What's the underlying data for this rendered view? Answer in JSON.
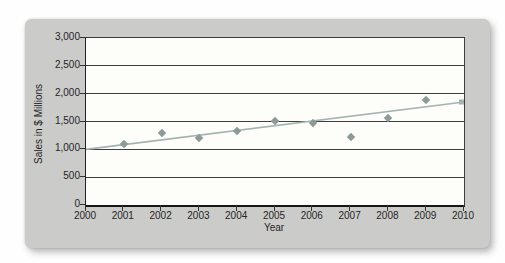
{
  "figure": {
    "page_background": "#fefefe",
    "panel_color": "#cbcbc9",
    "plot_background": "#fdfdfa",
    "gridline_color": "#3f3f3f",
    "text_color": "#262626"
  },
  "chart_data": {
    "type": "scatter",
    "title": "",
    "xlabel": "Year",
    "ylabel": "Sales in $ Millions",
    "xlim": [
      2000,
      2010
    ],
    "ylim": [
      0,
      3000
    ],
    "grid": "horizontal, every 500, dark thin lines",
    "legend": "none",
    "x_tick_labels": [
      "2000",
      "2001",
      "2002",
      "2003",
      "2004",
      "2005",
      "2006",
      "2007",
      "2008",
      "2009",
      "2010"
    ],
    "y_tick_labels": [
      "0",
      "500",
      "1,000",
      "1,500",
      "2,000",
      "2,500",
      "3,000"
    ],
    "y_tick_values": [
      0,
      500,
      1000,
      1500,
      2000,
      2500,
      3000
    ],
    "points": [
      {
        "year": 2001,
        "value": 1100
      },
      {
        "year": 2002,
        "value": 1290
      },
      {
        "year": 2003,
        "value": 1200
      },
      {
        "year": 2004,
        "value": 1330
      },
      {
        "year": 2005,
        "value": 1510
      },
      {
        "year": 2006,
        "value": 1480
      },
      {
        "year": 2007,
        "value": 1220
      },
      {
        "year": 2008,
        "value": 1560
      },
      {
        "year": 2009,
        "value": 1890
      }
    ],
    "point_color": "#8d9a97",
    "point_shape": "diamond",
    "trendline": {
      "x1": 2000,
      "y1": 1000,
      "x2": 2010,
      "y2": 1850,
      "color": "#a4b4b1",
      "end_marker": "small square"
    }
  }
}
